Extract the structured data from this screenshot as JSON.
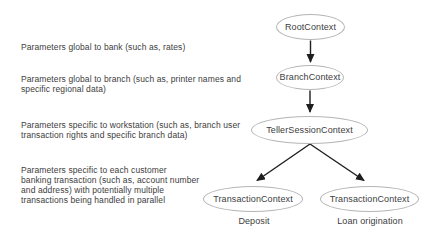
{
  "figure": {
    "colors": {
      "background": "#ffffff",
      "text": "#3d3d3d",
      "node_border": "#b5b5b5",
      "arrow": "#1e1e1e"
    },
    "nodes": {
      "root": {
        "label": "RootContext"
      },
      "branch": {
        "label": "BranchContext"
      },
      "teller": {
        "label": "TellerSessionContext"
      },
      "deposit": {
        "label": "TransactionContext",
        "caption": "Deposit"
      },
      "loan": {
        "label": "TransactionContext",
        "caption": "Loan origination"
      }
    },
    "annotations": [
      {
        "lines": [
          "Parameters global to bank (such as, rates)"
        ]
      },
      {
        "lines": [
          "Parameters global to branch (such as, printer names and",
          "specific regional data)"
        ]
      },
      {
        "lines": [
          "Parameters specific to workstation (such as, branch user",
          "transaction rights and specific branch data)"
        ]
      },
      {
        "lines": [
          "Parameters specific to each customer",
          "banking transaction (such as, account number",
          "and address) with potentially multiple",
          "transactions being handled in parallel"
        ]
      }
    ]
  }
}
